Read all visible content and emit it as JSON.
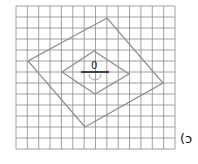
{
  "figure": {
    "center_label": "0",
    "figure_label": "(ɔ",
    "grid": {
      "columns": 14,
      "rows": 13
    },
    "colors": {
      "grid": "#8a8a8a",
      "shape": "#8f8f8f",
      "axis": "#111111"
    }
  }
}
